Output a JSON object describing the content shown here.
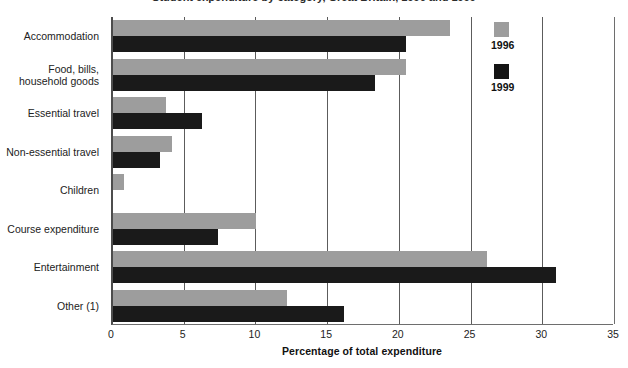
{
  "title": "Student expenditure by category, Great Britain, 1996 and 1999",
  "chart_data": {
    "type": "bar",
    "orientation": "horizontal",
    "title": "Student expenditure by category, Great Britain, 1996 and 1999",
    "xlabel": "Percentage of total expenditure",
    "ylabel": "",
    "xlim": [
      0,
      35
    ],
    "xticks": [
      0,
      5,
      10,
      15,
      20,
      25,
      30,
      35
    ],
    "grid": true,
    "legend_position": "inside-top-right",
    "categories": [
      "Accommodation",
      "Food, bills,\nhousehold goods",
      "Essential travel",
      "Non-essential travel",
      "Children",
      "Course expenditure",
      "Entertainment",
      "Other (1)"
    ],
    "series": [
      {
        "name": "1996",
        "color": "#9d9d9d",
        "values": [
          23.5,
          20.4,
          3.7,
          4.1,
          0.8,
          10.0,
          26.1,
          12.1
        ]
      },
      {
        "name": "1999",
        "color": "#141414",
        "values": [
          20.4,
          18.3,
          6.2,
          3.3,
          0.0,
          7.3,
          30.9,
          16.1
        ]
      }
    ]
  },
  "legend": {
    "items": [
      {
        "label": "1996",
        "swatch": "gray-swatch-icon"
      },
      {
        "label": "1999",
        "swatch": "black-swatch-icon"
      }
    ]
  },
  "axis": {
    "x_title": "Percentage of total expenditure",
    "x_tick_labels": [
      "0",
      "5",
      "10",
      "15",
      "20",
      "25",
      "30",
      "35"
    ]
  },
  "colors": {
    "series_1996": "#9d9d9d",
    "series_1999": "#141414",
    "axis": "#4d4d4d",
    "grid": "#5c5c5c",
    "background": "#ffffff"
  }
}
